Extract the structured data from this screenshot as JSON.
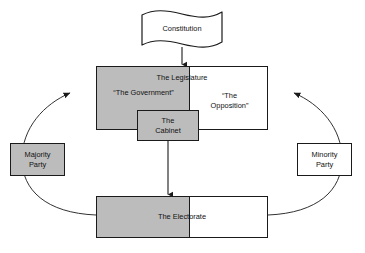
{
  "diagram": {
    "colors": {
      "gray_fill": "#bcbcbc",
      "white_fill": "#ffffff",
      "stroke": "#1a1a1a",
      "background": "#ffffff"
    },
    "nodes": {
      "constitution": {
        "label": "Constitution",
        "shape": "banner",
        "fill": "white"
      },
      "legislature": {
        "title": "The Legislature",
        "government_label": "“The Government”",
        "opposition_label": "“The\nOpposition”",
        "opposition_line1": "“The",
        "opposition_line2": "Opposition”",
        "left_fill": "gray",
        "right_fill": "white"
      },
      "cabinet": {
        "line1": "The",
        "line2": "Cabinet",
        "fill": "gray"
      },
      "electorate": {
        "label": "The Electorate",
        "left_fill": "gray",
        "right_fill": "white"
      },
      "majority_party": {
        "line1": "Majority",
        "line2": "Party",
        "fill": "gray"
      },
      "minority_party": {
        "line1": "Minority",
        "line2": "Party",
        "fill": "white"
      }
    },
    "connectors": [
      {
        "name": "constitution-to-legislature",
        "from": "constitution",
        "to": "legislature",
        "style": "straight-arrow",
        "direction": "down"
      },
      {
        "name": "cabinet-to-electorate",
        "from": "cabinet",
        "to": "electorate",
        "style": "straight-arrow",
        "direction": "down"
      },
      {
        "name": "electorate-to-legislature-left",
        "from": "electorate",
        "to": "legislature",
        "style": "curved-arrow",
        "direction": "counter-clockwise",
        "passes_behind": "majority_party"
      },
      {
        "name": "electorate-to-legislature-right",
        "from": "electorate",
        "to": "legislature",
        "style": "curved-arrow",
        "direction": "clockwise",
        "passes_behind": "minority_party"
      }
    ]
  }
}
